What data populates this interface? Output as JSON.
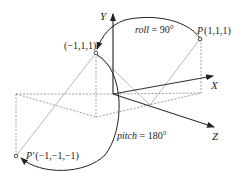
{
  "diagram": {
    "axes": {
      "x_label": "X",
      "y_label": "Y",
      "z_label": "Z"
    },
    "points": {
      "p": {
        "name": "P",
        "coords": "(1,1,1)"
      },
      "mid": {
        "coords": "(−1,1,1)"
      },
      "p_prime": {
        "name": "P′",
        "coords": "(−1,−1,−1)"
      }
    },
    "rotations": {
      "roll": {
        "name": "roll",
        "value": " = 90°"
      },
      "pitch": {
        "name": "pitch",
        "value": " = 180°"
      }
    },
    "colors": {
      "axis": "#333333",
      "guide": "#888888",
      "arc": "#222222"
    }
  }
}
